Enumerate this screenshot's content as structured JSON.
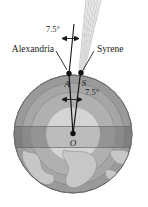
{
  "figure": {
    "labels": {
      "alexandria": "Alexandria",
      "syrene": "Syrene",
      "point_a": "A",
      "point_s": "S",
      "point_o": "O",
      "angle_top": "7.5°",
      "angle_center": "7.5°"
    },
    "geometry": {
      "angle_degrees": 7.5,
      "center": {
        "x": 73,
        "y": 134
      },
      "radius": 59,
      "point_a": {
        "x": 69,
        "y": 75
      },
      "point_s": {
        "x": 80,
        "y": 74
      },
      "ring_radii": [
        59,
        50,
        41,
        26
      ]
    },
    "colors": {
      "background": "#ffffff",
      "globe_outer": "#9a9a9a",
      "globe_ring_mid": "#a8a8a8",
      "globe_ring_inner": "#b4b4b4",
      "globe_core": "#d3d3d3",
      "equator_band": "#7e7e7e",
      "continent": "#c9c9c9",
      "sun_ray": "#c8c8c8",
      "line": "#1a1a1a",
      "text": "#1a1a1a"
    }
  }
}
